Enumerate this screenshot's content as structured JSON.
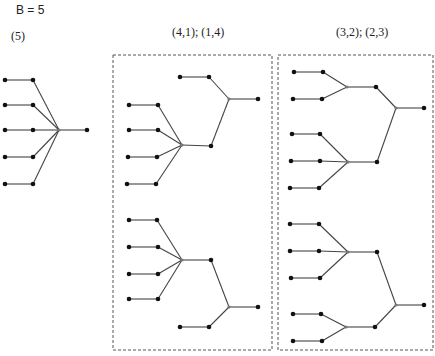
{
  "title": "B = 5",
  "groups": [
    {
      "label": "(5)",
      "trees": [
        {
          "edges": [
            [
              "l1",
              "m1"
            ],
            [
              "l2",
              "m2"
            ],
            [
              "l3",
              "m3"
            ],
            [
              "l4",
              "m4"
            ],
            [
              "l5",
              "m5"
            ],
            [
              "m1",
              "h"
            ],
            [
              "m2",
              "h"
            ],
            [
              "m3",
              "h"
            ],
            [
              "m4",
              "h"
            ],
            [
              "m5",
              "h"
            ],
            [
              "h",
              "r"
            ]
          ]
        }
      ]
    },
    {
      "label": "(4,1); (1,4)",
      "trees": [
        {
          "variant": "(4,1)"
        },
        {
          "variant": "(1,4)"
        }
      ]
    },
    {
      "label": "(3,2); (2,3)",
      "trees": [
        {
          "variant": "(3,2)"
        },
        {
          "variant": "(2,3)"
        }
      ]
    }
  ],
  "colors": {
    "edge": "#444444",
    "node": "#111111",
    "hub": "#777777",
    "box": "#555555"
  }
}
